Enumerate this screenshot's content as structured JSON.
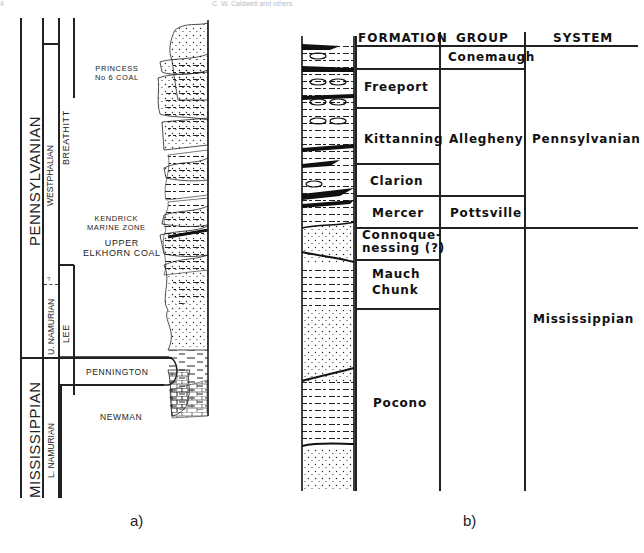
{
  "page_header": {
    "left": "4",
    "right": "C. W. Caldwell and others"
  },
  "panel_a": {
    "caption": "a)",
    "columns": {
      "system": [
        "PENNSYLVANIAN",
        "MISSISSIPPIAN"
      ],
      "stage": [
        "WESTPHALIAN",
        "U. NAMURIAN",
        "L. NAMURIAN"
      ],
      "stage_uncertain_mark": "?",
      "formation": [
        "BREATHITT",
        "LEE"
      ]
    },
    "units": [
      "PENNINGTON",
      "NEWMAN"
    ],
    "annotations": [
      {
        "line1": "PRINCESS",
        "line2": "No 6 COAL"
      },
      {
        "line1": "KENDRICK",
        "line2": "MARINE ZONE"
      },
      {
        "line1": "UPPER",
        "line2": "ELKHORN COAL"
      }
    ]
  },
  "panel_b": {
    "caption": "b)",
    "headers": {
      "formation": "FORMATION",
      "group": "GROUP",
      "system": "SYSTEM"
    },
    "formations": [
      {
        "name": "",
        "rows": 1
      },
      {
        "name": "Freeport"
      },
      {
        "name": "Kittanning"
      },
      {
        "name": "Clarion"
      },
      {
        "name": "Mercer"
      },
      {
        "line1": "Connoque-",
        "line2": "nessing (?)"
      },
      {
        "line1": "Mauch",
        "line2": "Chunk"
      },
      {
        "name": "Pocono"
      }
    ],
    "groups": [
      "Conemaugh",
      "Allegheny",
      "Pottsville"
    ],
    "systems": [
      "Pennsylvanian",
      "Mississippian"
    ]
  },
  "colors": {
    "ink": "#222222",
    "background": "#ffffff"
  }
}
